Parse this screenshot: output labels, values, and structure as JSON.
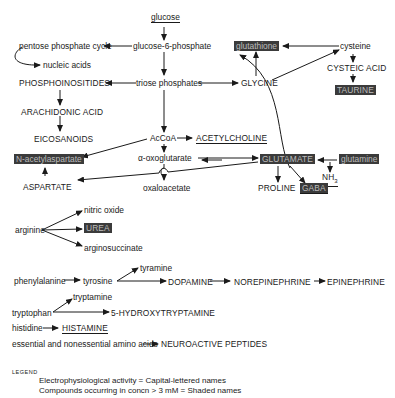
{
  "nodes": {
    "glucose": "glucose",
    "g6p": "glucose-6-phosphate",
    "ppc": "pentose phosphate cycle",
    "nucleic": "nucleic acids",
    "phosphoino": "PHOSPHOINOSITIDES",
    "triose": "triose phosphates",
    "glycine": "GLYCINE",
    "glutathione": "glutathione",
    "cysteine": "cysteine",
    "cysteic": "CYSTEIC ACID",
    "taurine": "TAURINE",
    "arachidonic": "ARACHIDONIC ACID",
    "eicosanoids": "EICOSANOIDS",
    "acoa": "AcCoA",
    "acetylcholine": "ACETYLCHOLINE",
    "nacetylasp": "N-acetylaspartate",
    "oxoglut": "α-oxoglutarate",
    "glutamate": "GLUTAMATE",
    "glutamine": "glutamine",
    "nh3": "NH",
    "nh3_sub": "3",
    "aspartate": "ASPARTATE",
    "oxaloacetate": "oxaloacetate",
    "proline": "PROLINE",
    "gaba": "GABA",
    "arginine": "arginine",
    "nitric": "nitric oxide",
    "urea": "UREA",
    "argsucc": "arginosuccinate",
    "phenylalanine": "phenylalanine",
    "tyrosine": "tyrosine",
    "tyramine": "tyramine",
    "dopamine": "DOPAMINE",
    "norepi": "NOREPINEPHRINE",
    "epi": "EPINEPHRINE",
    "tryptophan": "tryptophan",
    "tryptamine": "tryptamine",
    "ht5": "5-HYDROXYTRYPTAMINE",
    "histidine": "histidine",
    "histamine": "HISTAMINE",
    "aminoacids": "essential and nonessential amino acids",
    "peptides": "NEUROACTIVE PEPTIDES"
  },
  "legend": {
    "title": "LEGEND",
    "line1": "Electrophysiological activity = Capital-lettered names",
    "line2": "Compounds occurring in concn > 3 mM = Shaded names"
  },
  "colors": {
    "shade_bg": "#3b3b3b",
    "shade_text": "#bdbdbd",
    "ink": "#1a1a1a"
  }
}
